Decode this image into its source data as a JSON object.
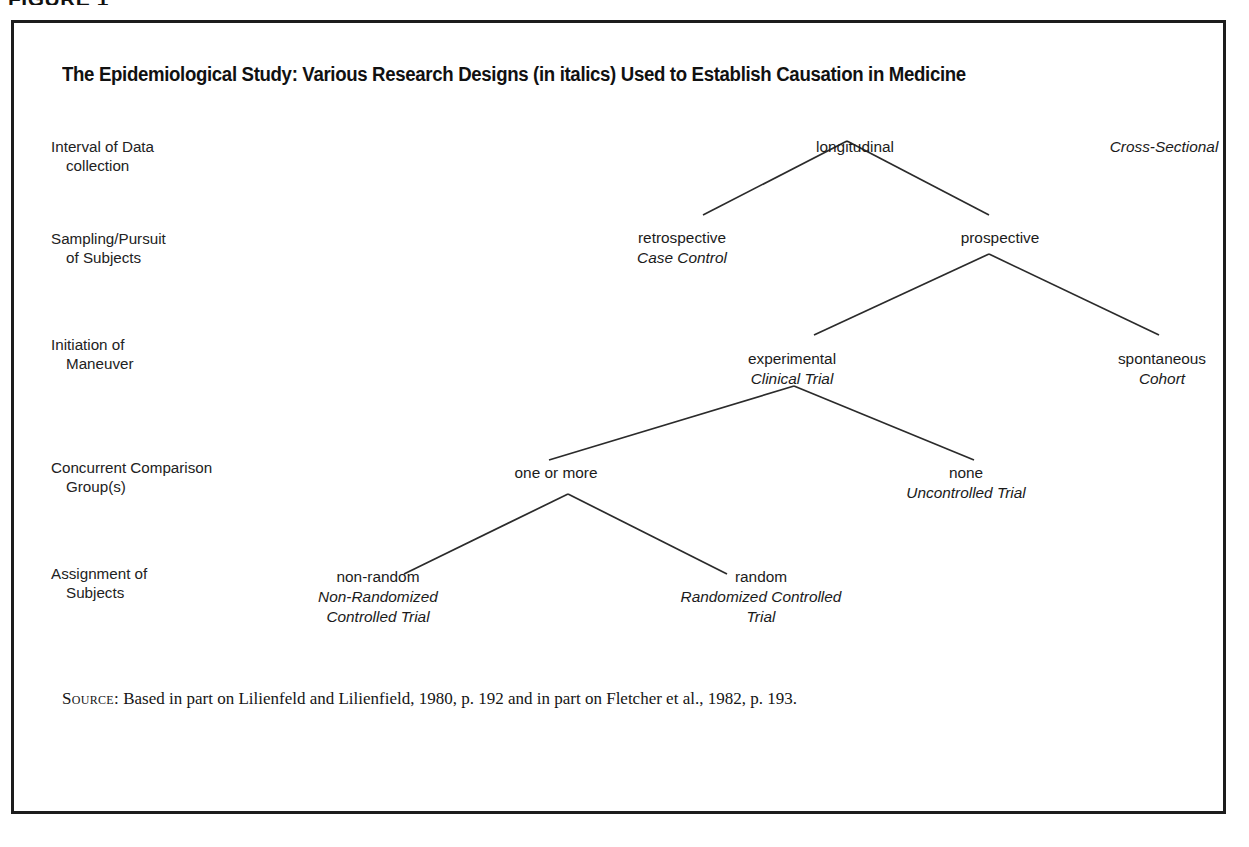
{
  "figure": {
    "running_head": "FIGURE 1",
    "title": "The Epidemiological Study: Various Research Designs (in italics) Used to Establish Causation in Medicine",
    "source_label": "Source:",
    "source_text": " Based in part on Lilienfeld and Lilienfield, 1980, p. 192 and in part on Fletcher et al., 1982, p. 193."
  },
  "rows": [
    {
      "line1": "Interval of Data",
      "line2": "collection"
    },
    {
      "line1": "Sampling/Pursuit",
      "line2": "of Subjects"
    },
    {
      "line1": "Initiation of",
      "line2": "Maneuver"
    },
    {
      "line1": "Concurrent Comparison",
      "line2": "Group(s)"
    },
    {
      "line1": "Assignment of",
      "line2": "Subjects"
    }
  ],
  "nodes": [
    {
      "term": "longitudinal",
      "design": ""
    },
    {
      "term": "",
      "design": "Cross-Sectional"
    },
    {
      "term": "retrospective",
      "design": "Case Control"
    },
    {
      "term": "prospective",
      "design": ""
    },
    {
      "term": "experimental",
      "design": "Clinical Trial"
    },
    {
      "term": "spontaneous",
      "design": "Cohort"
    },
    {
      "term": "one or more",
      "design": ""
    },
    {
      "term": "none",
      "design": "Uncontrolled Trial"
    },
    {
      "term": "non-random",
      "design": "Non-Randomized Controlled Trial"
    },
    {
      "term": "random",
      "design": "Randomized Controlled Trial"
    }
  ],
  "node_text": {
    "longitudinal": "longitudinal",
    "cross_sectional": "Cross-Sectional",
    "retrospective": "retrospective",
    "case_control": "Case Control",
    "prospective": "prospective",
    "experimental": "experimental",
    "clinical_trial": "Clinical Trial",
    "spontaneous": "spontaneous",
    "cohort": "Cohort",
    "one_or_more": "one or more",
    "none": "none",
    "uncontrolled_trial": "Uncontrolled Trial",
    "non_random": "non-random",
    "non_randomized_l1": "Non-Randomized",
    "non_randomized_l2": "Controlled Trial",
    "random": "random",
    "randomized_l1": "Randomized Controlled",
    "randomized_l2": "Trial"
  },
  "colors": {
    "border": "#1d1d1d",
    "text": "#1b1b1b",
    "connector": "#2b2b2b",
    "background": "#ffffff"
  }
}
